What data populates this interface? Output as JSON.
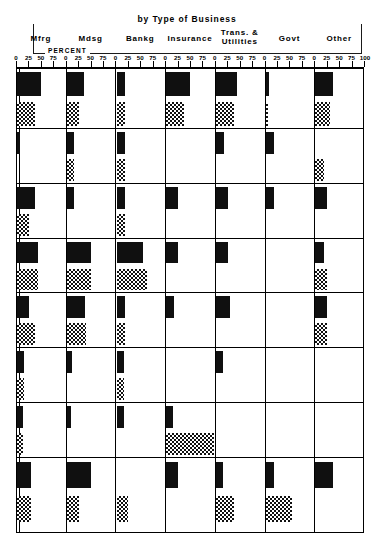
{
  "header": {
    "title": "by Type of Business",
    "percent_label": "PERCENT",
    "columns": [
      {
        "line1": "Mfrg",
        "line2": ""
      },
      {
        "line1": "Mdsg",
        "line2": ""
      },
      {
        "line1": "Bankg",
        "line2": ""
      },
      {
        "line1": "Insurance",
        "line2": ""
      },
      {
        "line1": "Trans. &",
        "line2": "Utilities"
      },
      {
        "line1": "Govt",
        "line2": ""
      },
      {
        "line1": "Other",
        "line2": ""
      }
    ]
  },
  "axis": {
    "ticks": [
      "0",
      "25",
      "50",
      "75"
    ],
    "final_tick": "100",
    "min": 0,
    "max": 100
  },
  "chart_data": {
    "type": "bar",
    "title": "by Type of Business",
    "xlabel": "PERCENT",
    "ylabel": "",
    "xlim": [
      0,
      100
    ],
    "grid": true,
    "orientation": "horizontal",
    "legend": [
      "solid",
      "checkered"
    ],
    "categories": [
      "Mfrg",
      "Mdsg",
      "Bankg",
      "Insurance",
      "Trans. & Utilities",
      "Govt",
      "Other"
    ],
    "rows": [
      {
        "row": 1,
        "solid": [
          50,
          37,
          18,
          50,
          45,
          7,
          38
        ],
        "hatch": [
          37,
          25,
          17,
          37,
          38,
          3,
          30
        ]
      },
      {
        "row": 2,
        "solid": [
          7,
          15,
          17,
          0,
          17,
          17,
          0
        ],
        "hatch": [
          0,
          15,
          17,
          0,
          0,
          0,
          17
        ]
      },
      {
        "row": 3,
        "solid": [
          38,
          15,
          17,
          25,
          25,
          17,
          25
        ],
        "hatch": [
          25,
          0,
          17,
          0,
          0,
          0,
          0
        ]
      },
      {
        "row": 4,
        "solid": [
          45,
          50,
          55,
          25,
          25,
          0,
          17
        ],
        "hatch": [
          45,
          50,
          65,
          0,
          0,
          0,
          25
        ]
      },
      {
        "row": 5,
        "solid": [
          25,
          38,
          17,
          17,
          30,
          0,
          25
        ],
        "hatch": [
          38,
          40,
          17,
          0,
          0,
          0,
          25
        ]
      },
      {
        "row": 6,
        "solid": [
          15,
          10,
          15,
          0,
          15,
          0,
          0
        ],
        "hatch": [
          15,
          0,
          15,
          0,
          0,
          0,
          0
        ]
      },
      {
        "row": 7,
        "solid": [
          13,
          8,
          15,
          15,
          0,
          0,
          0
        ],
        "hatch": [
          12,
          0,
          0,
          100,
          0,
          0,
          0
        ]
      },
      {
        "row": 8,
        "solid": [
          30,
          50,
          0,
          25,
          15,
          17,
          38
        ],
        "hatch": [
          30,
          25,
          25,
          0,
          38,
          55,
          0
        ]
      }
    ]
  }
}
